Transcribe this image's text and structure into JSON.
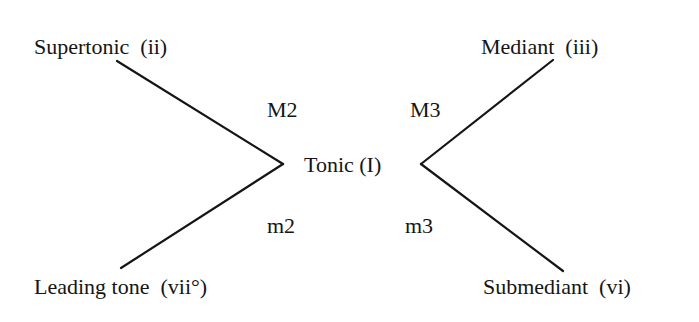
{
  "diagram": {
    "center": {
      "label": "Tonic (I)"
    },
    "nodes": {
      "supertonic": "Supertonic  (ii)",
      "mediant": "Mediant  (iii)",
      "leading_tone": "Leading tone  (vii°)",
      "submediant": "Submediant  (vi)"
    },
    "intervals": {
      "supertonic": "M2",
      "mediant": "M3",
      "leading_tone": "m2",
      "submediant": "m3"
    },
    "colors": {
      "ink": "#151515",
      "background": "#ffffff"
    }
  }
}
